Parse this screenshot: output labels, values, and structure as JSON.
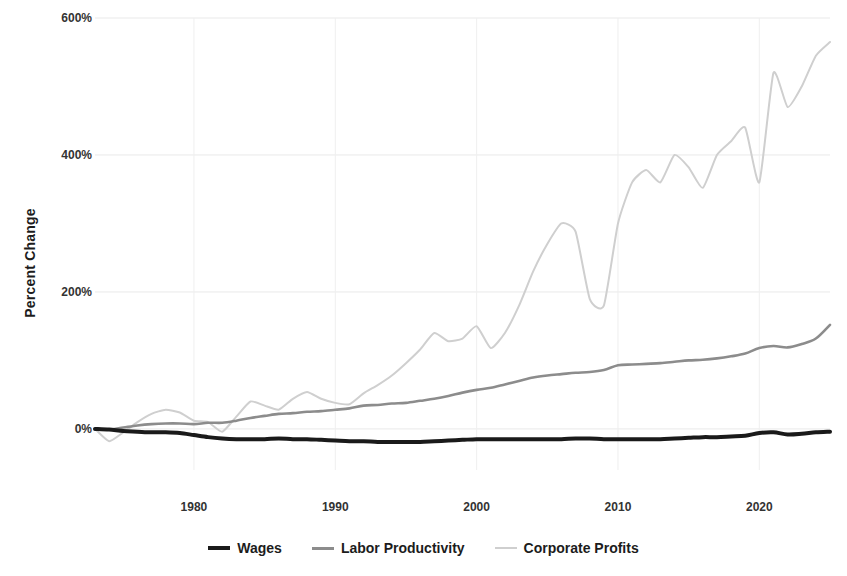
{
  "chart_data": {
    "type": "line",
    "title": "",
    "subtitle": "",
    "xlabel": "",
    "ylabel": "Percent Change",
    "xlim": [
      1973,
      2025
    ],
    "ylim": [
      -60,
      600
    ],
    "grid": true,
    "legend_position": "bottom-center",
    "y_ticks": [
      "0%",
      "200%",
      "400%",
      "600%"
    ],
    "y_tick_values": [
      0,
      200,
      400,
      600
    ],
    "x_ticks": [
      "1980",
      "1990",
      "2000",
      "2010",
      "2020"
    ],
    "x_tick_values": [
      1980,
      1990,
      2000,
      2010,
      2020
    ],
    "colors": {
      "wages": "#1a1a1a",
      "labor_productivity": "#8c8c8c",
      "corporate_profits": "#cfcfcf",
      "grid": "#e9e9e9",
      "background": "#ffffff",
      "text": "#1c1c1c"
    },
    "x": [
      1973,
      1974,
      1975,
      1976,
      1977,
      1978,
      1979,
      1980,
      1981,
      1982,
      1983,
      1984,
      1985,
      1986,
      1987,
      1988,
      1989,
      1990,
      1991,
      1992,
      1993,
      1994,
      1995,
      1996,
      1997,
      1998,
      1999,
      2000,
      2001,
      2002,
      2003,
      2004,
      2005,
      2006,
      2007,
      2008,
      2009,
      2010,
      2011,
      2012,
      2013,
      2014,
      2015,
      2016,
      2017,
      2018,
      2019,
      2020,
      2021,
      2022,
      2023,
      2024,
      2025
    ],
    "series": [
      {
        "name": "Wages",
        "color": "#1a1a1a",
        "width": 4,
        "values": [
          0,
          -1,
          -3,
          -4,
          -5,
          -5,
          -6,
          -9,
          -12,
          -14,
          -15,
          -15,
          -15,
          -14,
          -15,
          -15,
          -16,
          -17,
          -18,
          -18,
          -19,
          -19,
          -19,
          -19,
          -18,
          -17,
          -16,
          -15,
          -15,
          -15,
          -15,
          -15,
          -15,
          -15,
          -14,
          -14,
          -15,
          -15,
          -15,
          -15,
          -15,
          -14,
          -13,
          -12,
          -12,
          -11,
          -10,
          -6,
          -5,
          -8,
          -7,
          -5,
          -4
        ]
      },
      {
        "name": "Labor Productivity",
        "color": "#8c8c8c",
        "width": 2.6,
        "values": [
          0,
          -1,
          2,
          5,
          7,
          8,
          8,
          7,
          9,
          9,
          12,
          16,
          19,
          22,
          23,
          25,
          26,
          28,
          30,
          34,
          35,
          37,
          38,
          41,
          44,
          48,
          53,
          57,
          60,
          65,
          70,
          75,
          78,
          80,
          82,
          83,
          86,
          93,
          94,
          95,
          96,
          98,
          100,
          101,
          103,
          106,
          110,
          118,
          121,
          119,
          124,
          132,
          152
        ]
      },
      {
        "name": "Corporate Profits",
        "color": "#cfcfcf",
        "width": 2,
        "values": [
          0,
          -18,
          -5,
          10,
          22,
          28,
          24,
          12,
          10,
          -4,
          18,
          40,
          34,
          28,
          44,
          54,
          44,
          38,
          36,
          52,
          64,
          78,
          96,
          116,
          140,
          128,
          132,
          150,
          118,
          140,
          180,
          230,
          270,
          300,
          288,
          190,
          180,
          300,
          360,
          378,
          360,
          400,
          382,
          352,
          400,
          420,
          440,
          360,
          520,
          470,
          500,
          545,
          565
        ]
      }
    ],
    "annotations": []
  },
  "axes": {
    "y_title": "Percent Change",
    "y_ticks": [
      {
        "label": "600%",
        "value": 600
      },
      {
        "label": "400%",
        "value": 400
      },
      {
        "label": "200%",
        "value": 200
      },
      {
        "label": "0%",
        "value": 0
      }
    ],
    "x_ticks": [
      {
        "label": "1980",
        "value": 1980
      },
      {
        "label": "1990",
        "value": 1990
      },
      {
        "label": "2000",
        "value": 2000
      },
      {
        "label": "2010",
        "value": 2010
      },
      {
        "label": "2020",
        "value": 2020
      }
    ]
  },
  "legend": {
    "items": [
      {
        "label": "Wages",
        "color": "#1a1a1a",
        "thickness": 4
      },
      {
        "label": "Labor Productivity",
        "color": "#8c8c8c",
        "thickness": 3
      },
      {
        "label": "Corporate Profits",
        "color": "#cfcfcf",
        "thickness": 2
      }
    ]
  }
}
